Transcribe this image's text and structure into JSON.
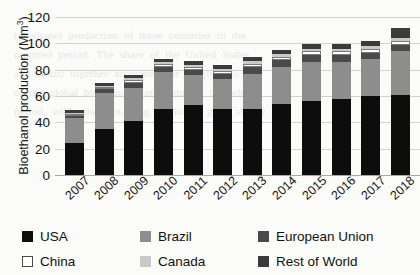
{
  "chart_data": {
    "type": "bar",
    "subtype": "stacked-column",
    "title": "",
    "xlabel": "",
    "ylabel": "Bioethanol production (Mm³)",
    "ylabel_parts": {
      "text": "Bioethanol production (Mm",
      "sup": "3",
      "close": ")"
    },
    "ylim": [
      0,
      120
    ],
    "ytick_step": 20,
    "yticks": [
      "0",
      "20",
      "40",
      "60",
      "80",
      "100",
      "120"
    ],
    "grid": true,
    "legend_position": "bottom",
    "categories": [
      "2007",
      "2008",
      "2009",
      "2010",
      "2011",
      "2012",
      "2013",
      "2014",
      "2015",
      "2016",
      "2017",
      "2018"
    ],
    "series": [
      {
        "name": "USA",
        "color": "#0d0d0d",
        "values": [
          24,
          35,
          41,
          50,
          53,
          50,
          50,
          54,
          56,
          58,
          60,
          61
        ]
      },
      {
        "name": "Brazil",
        "color": "#8d8d8d",
        "values": [
          19,
          27,
          25,
          28,
          23,
          23,
          27,
          28,
          30,
          28,
          28,
          33
        ]
      },
      {
        "name": "European Union",
        "color": "#4a4a4a",
        "values": [
          2,
          3,
          4,
          4,
          4,
          4,
          5,
          5,
          5,
          5,
          5,
          5
        ]
      },
      {
        "name": "China",
        "color": "#ffffff",
        "values": [
          1.5,
          2,
          2,
          2,
          2,
          2,
          2.5,
          3,
          3,
          3,
          3,
          3
        ]
      },
      {
        "name": "Canada",
        "color": "#c9c9c9",
        "values": [
          0.8,
          1,
          1.5,
          1.5,
          1.8,
          1.8,
          1.8,
          1.8,
          1.8,
          1.8,
          1.8,
          1.8
        ]
      },
      {
        "name": "Rest of World",
        "color": "#3b3b3b",
        "values": [
          2,
          2,
          2.5,
          3,
          3,
          3,
          3,
          3.5,
          3.5,
          4,
          4,
          8
        ]
      }
    ],
    "totals": [
      49.3,
      70,
      76,
      88.5,
      86.8,
      83.8,
      89.3,
      95.3,
      99.3,
      99.8,
      101.8,
      111.8
    ]
  },
  "legend": {
    "items": [
      {
        "label": "USA",
        "swatch": "usa"
      },
      {
        "label": "Brazil",
        "swatch": "brazil"
      },
      {
        "label": "European Union",
        "swatch": "eu"
      },
      {
        "label": "China",
        "swatch": "china"
      },
      {
        "label": "Canada",
        "swatch": "canada"
      },
      {
        "label": "Rest of World",
        "swatch": "row"
      }
    ]
  },
  "page_bleed": "bioethanol  production  of  these  countries  in  the\nreported  period.  The  share  of  the  United  States\nand  Brazil  together  accounted  for  roughly  85  %\nof  the  global  bioethanol  output  during  the  whole\nperiod,  while  the  remaining  producers  grew  slowly."
}
